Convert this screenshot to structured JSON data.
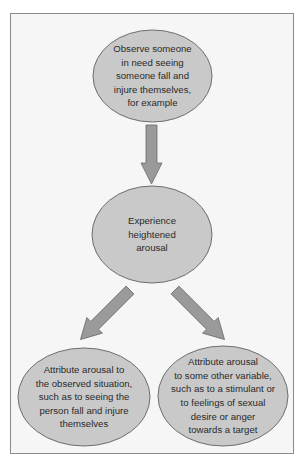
{
  "diagram": {
    "nodes": [
      {
        "id": "observe",
        "label": "Observe someone\nin need seeing\nsomeone fall and\ninjure themselves,\nfor example"
      },
      {
        "id": "arousal",
        "label": "Experience\nheightened\narousal"
      },
      {
        "id": "attribute-situation",
        "label": "Attribute arousal to\nthe observed situation,\nsuch as to seeing the\nperson fall and injure\nthemselves"
      },
      {
        "id": "attribute-other",
        "label": "Attribute arousal\nto some other variable,\nsuch as to a stimulant or\nto feelings of sexual\ndesire or anger\ntowards a target"
      }
    ],
    "edges": [
      {
        "from": "observe",
        "to": "arousal"
      },
      {
        "from": "arousal",
        "to": "attribute-situation"
      },
      {
        "from": "arousal",
        "to": "attribute-other"
      }
    ],
    "colors": {
      "node_fill": "#c9c9c9",
      "node_stroke": "#6e6e6e",
      "arrow_fill": "#9a9a9a",
      "arrow_stroke": "#6a6a6a",
      "frame_bg": "#f6f6f6",
      "frame_border": "#8a8a8a"
    }
  }
}
